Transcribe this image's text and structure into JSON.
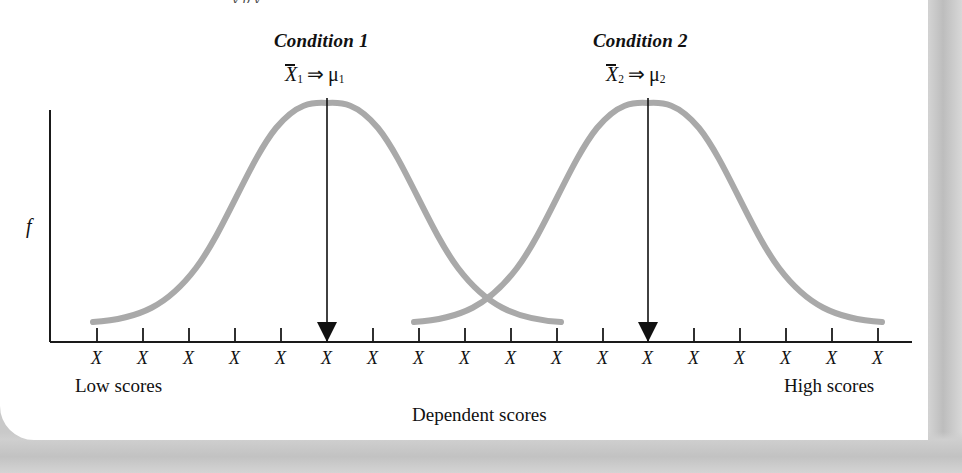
{
  "figure": {
    "title_partial": "y     p                  y",
    "y_axis_label": "f",
    "x_axis_title": "Dependent scores",
    "low_label": "Low scores",
    "high_label": "High scores",
    "curve_color": "#a9a9a9",
    "axis_color": "#1a1a1a",
    "arrow_color": "#111111",
    "groups": [
      {
        "name": "Condition 1",
        "math": {
          "mean_symbol": "X",
          "mean_subscript": "1",
          "implies": "⇒",
          "mu_symbol": "μ",
          "mu_subscript": "1"
        },
        "peak_x": 327,
        "peak_y": 103
      },
      {
        "name": "Condition 2",
        "math": {
          "mean_symbol": "X",
          "mean_subscript": "2",
          "implies": "⇒",
          "mu_symbol": "μ",
          "mu_subscript": "2"
        },
        "peak_x": 648,
        "peak_y": 103
      }
    ],
    "tick_labels": [
      "X",
      "X",
      "X",
      "X",
      "X",
      "X",
      "X",
      "X",
      "X",
      "X",
      "X",
      "X",
      "X",
      "X",
      "X",
      "X",
      "X",
      "X"
    ]
  },
  "chart_data": {
    "type": "line",
    "title": "",
    "xlabel": "Dependent scores",
    "ylabel": "f",
    "grid": false,
    "legend": "none",
    "x": [
      1,
      2,
      3,
      4,
      5,
      6,
      7,
      8,
      9,
      10,
      11,
      12,
      13,
      14,
      15,
      16,
      17,
      18
    ],
    "tick_labels": [
      "X",
      "X",
      "X",
      "X",
      "X",
      "X",
      "X",
      "X",
      "X",
      "X",
      "X",
      "X",
      "X",
      "X",
      "X",
      "X",
      "X",
      "X"
    ],
    "axis_endpoint_labels": [
      "Low scores",
      "High scores"
    ],
    "series": [
      {
        "name": "Condition 1",
        "mean_label": "X̅1 ⇒ μ1",
        "mean_tick_index": 6,
        "peak_value": 1.0,
        "values": [
          0.02,
          0.08,
          0.22,
          0.48,
          0.78,
          0.98,
          1.0,
          0.84,
          0.56,
          0.3,
          0.12,
          0.04,
          0.01,
          0,
          0,
          0,
          0,
          0
        ]
      },
      {
        "name": "Condition 2",
        "mean_label": "X̅2 ⇒ μ2",
        "mean_tick_index": 13,
        "peak_value": 1.0,
        "values": [
          0,
          0,
          0,
          0,
          0,
          0,
          0.01,
          0.04,
          0.12,
          0.3,
          0.56,
          0.84,
          1.0,
          0.98,
          0.78,
          0.48,
          0.22,
          0.06
        ]
      }
    ],
    "annotations": [
      {
        "text": "Condition 1",
        "at_tick_index": 6
      },
      {
        "text": "Condition 2",
        "at_tick_index": 13
      }
    ],
    "ylim": [
      0,
      1.05
    ]
  }
}
